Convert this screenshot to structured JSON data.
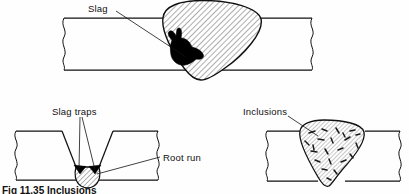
{
  "figure": {
    "caption": "Fig 11.35 Inclusions",
    "background_color": "#fefefe",
    "line_color": "#111111",
    "defect_fill_color": "#000000",
    "weld_hatch_color": "#555555"
  },
  "labels": {
    "slag": "Slag",
    "slag_traps": "Slag traps",
    "root_run": "Root run",
    "inclusions": "Inclusions"
  },
  "panels": [
    {
      "id": "top-weld",
      "name": "slag-in-weld-bead",
      "description": "Butt weld in plate with large hatched weld bead containing a black slag inclusion on the left flank",
      "label": "Slag",
      "plate": {
        "top_y": 18,
        "bottom_y": 70,
        "left_x": 62,
        "right_x": 312
      },
      "weld_bead": "hatched teardrop bead proud of both plate surfaces",
      "defect": "black irregular slag blob"
    },
    {
      "id": "bottom-left-groove",
      "name": "slag-traps-root-run",
      "description": "Single-V butt preparation with a hatched root run and black slag traps trapped at the groove toes",
      "labels": [
        "Slag traps",
        "Root run"
      ],
      "plate": {
        "top_y": 131,
        "bottom_y": 180,
        "left_x": 14,
        "right_x": 158
      },
      "groove": "single-V preparation",
      "defect": "two black triangular slag traps either side of root run"
    },
    {
      "id": "bottom-right-weld",
      "name": "inclusions-in-weld-bead",
      "description": "Butt weld with hatched bead containing many small scattered dark slag inclusions",
      "label": "Inclusions",
      "plate": {
        "top_y": 131,
        "bottom_y": 181,
        "left_x": 265,
        "right_x": 400
      },
      "weld_bead": "hatched bead proud of plate",
      "defect": "numerous short dark dash-shaped inclusions distributed through bead"
    }
  ]
}
